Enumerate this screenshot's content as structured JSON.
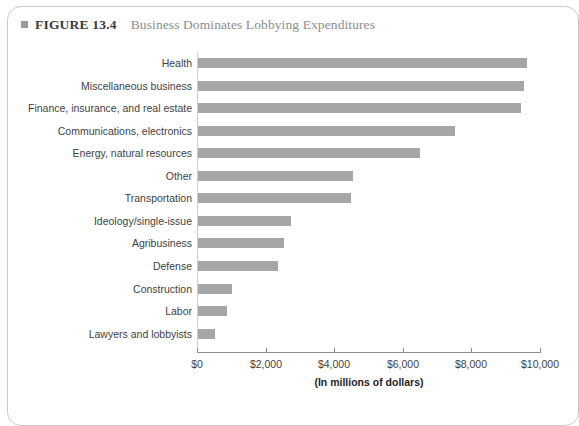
{
  "figure": {
    "bullet_icon": "square-bullet-icon",
    "label": "FIGURE 13.4",
    "title": "Business Dominates Lobbying Expenditures"
  },
  "chart_data": {
    "type": "bar",
    "orientation": "horizontal",
    "title": "Business Dominates Lobbying Expenditures",
    "xlabel": "(In millions of dollars)",
    "ylabel": "",
    "xlim": [
      0,
      10000
    ],
    "xticks": [
      0,
      2000,
      4000,
      6000,
      8000,
      10000
    ],
    "xtick_labels": [
      "$0",
      "$2,000",
      "$4,000",
      "$6,000",
      "$8,000",
      "$10,000"
    ],
    "grid": false,
    "legend": false,
    "bar_color": "#a6a6a6",
    "categories": [
      "Health",
      "Miscellaneous business",
      "Finance, insurance, and real estate",
      "Communications, electronics",
      "Energy, natural resources",
      "Other",
      "Transportation",
      "Ideology/single-issue",
      "Agribusiness",
      "Defense",
      "Construction",
      "Labor",
      "Lawyers and lobbyists"
    ],
    "values": [
      9580,
      9490,
      9430,
      7490,
      6470,
      4530,
      4470,
      2700,
      2500,
      2320,
      1000,
      850,
      500
    ]
  },
  "colors": {
    "bar": "#a6a6a6",
    "axis": "#8e8e8e",
    "label_text": "#3f3f3f",
    "caption_title": "#8d8d8d",
    "caption_label": "#3b3b3b",
    "frame": "#c9c9c9"
  }
}
